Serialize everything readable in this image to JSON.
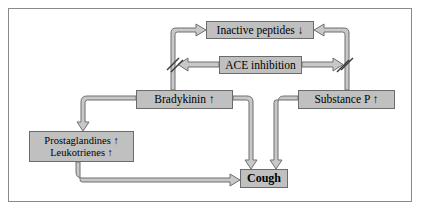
{
  "diagram": {
    "colors": {
      "node_fill": "#c0c0c0",
      "node_border": "#6b6b6b",
      "arrow_fill": "#c8c8c8",
      "arrow_stroke": "#6f6f6f",
      "frame_border": "#8a8a8a",
      "background": "#ffffff"
    },
    "nodes": [
      {
        "id": "inactive-peptides",
        "label": "Inactive peptides ↓"
      },
      {
        "id": "ace-inhibition",
        "label": "ACE inhibition"
      },
      {
        "id": "bradykinin",
        "label": "Bradykinin ↑"
      },
      {
        "id": "substance-p",
        "label": "Substance P ↑"
      },
      {
        "id": "prostaglandines",
        "line1": "Prostaglandines ↑",
        "line2": "Leukotrienes ↑"
      },
      {
        "id": "cough",
        "label": "Cough"
      }
    ],
    "edges": [
      {
        "id": "bradykinin-to-inactive-peptides",
        "from": "bradykinin",
        "to": "inactive-peptides",
        "kind": "blocked-arrow"
      },
      {
        "id": "substance-p-to-inactive-peptides",
        "from": "substance-p",
        "to": "inactive-peptides",
        "kind": "blocked-arrow"
      },
      {
        "id": "ace-inhibition-to-bradykinin-path",
        "from": "ace-inhibition",
        "to": "bradykinin-path",
        "kind": "arrow"
      },
      {
        "id": "ace-inhibition-to-substance-p-path",
        "from": "ace-inhibition",
        "to": "substance-p-path",
        "kind": "arrow"
      },
      {
        "id": "bradykinin-to-prostaglandines",
        "from": "bradykinin",
        "to": "prostaglandines",
        "kind": "arrow"
      },
      {
        "id": "bradykinin-to-cough",
        "from": "bradykinin",
        "to": "cough",
        "kind": "arrow"
      },
      {
        "id": "substance-p-to-cough",
        "from": "substance-p",
        "to": "cough",
        "kind": "arrow"
      },
      {
        "id": "prostaglandines-to-cough",
        "from": "prostaglandines",
        "to": "cough",
        "kind": "arrow"
      }
    ]
  }
}
